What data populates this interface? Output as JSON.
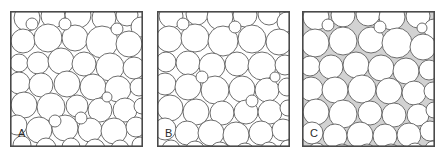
{
  "figure": {
    "background_color": "#ffffff",
    "panel_count": 3
  },
  "style": {
    "border_color": "#4a4a4a",
    "border_width": 1.6,
    "circle_stroke": "#6e6e6e",
    "circle_stroke_width": 1.0,
    "circle_fill_white": "#ffffff",
    "panel_fill_white": "#ffffff",
    "panel_fill_gray": "#d2d2d2",
    "label_color": "#2b2b2b"
  },
  "panels": [
    {
      "id": "panel-a",
      "label": "A",
      "label_x": 8,
      "label_y": 117,
      "x": 10,
      "y": 11,
      "width": 133,
      "height": 136,
      "interstitial_shaded": false,
      "interstitial_color": "#ffffff",
      "circle_count": 47,
      "circles": [
        {
          "cx": 17,
          "cy": 7,
          "r": 13
        },
        {
          "cx": 43,
          "cy": 5,
          "r": 12
        },
        {
          "cx": 68,
          "cy": 4,
          "r": 13
        },
        {
          "cx": 94,
          "cy": 7,
          "r": 12
        },
        {
          "cx": 117,
          "cy": 4,
          "r": 11
        },
        {
          "cx": 131,
          "cy": 16,
          "r": 10
        },
        {
          "cx": 13,
          "cy": 30,
          "r": 12
        },
        {
          "cx": 38,
          "cy": 27,
          "r": 14
        },
        {
          "cx": 65,
          "cy": 27,
          "r": 13
        },
        {
          "cx": 92,
          "cy": 31,
          "r": 16
        },
        {
          "cx": 119,
          "cy": 33,
          "r": 13
        },
        {
          "cx": 9,
          "cy": 52,
          "r": 9
        },
        {
          "cx": 28,
          "cy": 52,
          "r": 11
        },
        {
          "cx": 51,
          "cy": 50,
          "r": 13
        },
        {
          "cx": 74,
          "cy": 53,
          "r": 12
        },
        {
          "cx": 100,
          "cy": 56,
          "r": 14
        },
        {
          "cx": 124,
          "cy": 57,
          "r": 11
        },
        {
          "cx": 9,
          "cy": 72,
          "r": 11
        },
        {
          "cx": 31,
          "cy": 74,
          "r": 12
        },
        {
          "cx": 57,
          "cy": 73,
          "r": 13
        },
        {
          "cx": 83,
          "cy": 76,
          "r": 13
        },
        {
          "cx": 108,
          "cy": 78,
          "r": 13
        },
        {
          "cx": 129,
          "cy": 76,
          "r": 9
        },
        {
          "cx": 14,
          "cy": 94,
          "r": 13
        },
        {
          "cx": 41,
          "cy": 96,
          "r": 14
        },
        {
          "cx": 67,
          "cy": 95,
          "r": 11
        },
        {
          "cx": 90,
          "cy": 99,
          "r": 12
        },
        {
          "cx": 115,
          "cy": 99,
          "r": 12
        },
        {
          "cx": 132,
          "cy": 95,
          "r": 8
        },
        {
          "cx": 7,
          "cy": 114,
          "r": 10
        },
        {
          "cx": 29,
          "cy": 119,
          "r": 13
        },
        {
          "cx": 55,
          "cy": 117,
          "r": 13
        },
        {
          "cx": 80,
          "cy": 119,
          "r": 12
        },
        {
          "cx": 104,
          "cy": 120,
          "r": 13
        },
        {
          "cx": 126,
          "cy": 116,
          "r": 10
        },
        {
          "cx": 12,
          "cy": 134,
          "r": 9
        },
        {
          "cx": 36,
          "cy": 137,
          "r": 10
        },
        {
          "cx": 61,
          "cy": 136,
          "r": 9
        },
        {
          "cx": 85,
          "cy": 138,
          "r": 10
        },
        {
          "cx": 110,
          "cy": 138,
          "r": 9
        },
        {
          "cx": 130,
          "cy": 134,
          "r": 8
        },
        {
          "cx": 22,
          "cy": 13,
          "r": 6
        },
        {
          "cx": 55,
          "cy": 13,
          "r": 6
        },
        {
          "cx": 107,
          "cy": 18,
          "r": 6
        },
        {
          "cx": 45,
          "cy": 110,
          "r": 6
        },
        {
          "cx": 71,
          "cy": 107,
          "r": 6
        },
        {
          "cx": 97,
          "cy": 86,
          "r": 5
        }
      ]
    },
    {
      "id": "panel-b",
      "label": "B",
      "label_x": 8,
      "label_y": 117,
      "x": 157,
      "y": 11,
      "width": 133,
      "height": 136,
      "interstitial_shaded": false,
      "interstitial_color": "#ffffff",
      "circle_count": 46,
      "circles": [
        {
          "cx": 14,
          "cy": 5,
          "r": 12
        },
        {
          "cx": 40,
          "cy": 3,
          "r": 11
        },
        {
          "cx": 63,
          "cy": 6,
          "r": 13
        },
        {
          "cx": 88,
          "cy": 4,
          "r": 12
        },
        {
          "cx": 112,
          "cy": 3,
          "r": 11
        },
        {
          "cx": 130,
          "cy": 11,
          "r": 10
        },
        {
          "cx": 12,
          "cy": 28,
          "r": 13
        },
        {
          "cx": 38,
          "cy": 27,
          "r": 14
        },
        {
          "cx": 66,
          "cy": 30,
          "r": 15
        },
        {
          "cx": 95,
          "cy": 28,
          "r": 14
        },
        {
          "cx": 122,
          "cy": 31,
          "r": 13
        },
        {
          "cx": 9,
          "cy": 51,
          "r": 10
        },
        {
          "cx": 31,
          "cy": 52,
          "r": 12
        },
        {
          "cx": 55,
          "cy": 55,
          "r": 13
        },
        {
          "cx": 80,
          "cy": 53,
          "r": 12
        },
        {
          "cx": 105,
          "cy": 55,
          "r": 14
        },
        {
          "cx": 128,
          "cy": 54,
          "r": 10
        },
        {
          "cx": 8,
          "cy": 73,
          "r": 11
        },
        {
          "cx": 31,
          "cy": 76,
          "r": 13
        },
        {
          "cx": 58,
          "cy": 79,
          "r": 14
        },
        {
          "cx": 85,
          "cy": 78,
          "r": 13
        },
        {
          "cx": 110,
          "cy": 79,
          "r": 12
        },
        {
          "cx": 130,
          "cy": 76,
          "r": 9
        },
        {
          "cx": 13,
          "cy": 97,
          "r": 13
        },
        {
          "cx": 39,
          "cy": 101,
          "r": 13
        },
        {
          "cx": 65,
          "cy": 102,
          "r": 12
        },
        {
          "cx": 89,
          "cy": 101,
          "r": 12
        },
        {
          "cx": 113,
          "cy": 101,
          "r": 12
        },
        {
          "cx": 131,
          "cy": 97,
          "r": 8
        },
        {
          "cx": 8,
          "cy": 118,
          "r": 11
        },
        {
          "cx": 30,
          "cy": 122,
          "r": 12
        },
        {
          "cx": 54,
          "cy": 122,
          "r": 13
        },
        {
          "cx": 79,
          "cy": 124,
          "r": 13
        },
        {
          "cx": 104,
          "cy": 122,
          "r": 12
        },
        {
          "cx": 126,
          "cy": 119,
          "r": 11
        },
        {
          "cx": 14,
          "cy": 138,
          "r": 9
        },
        {
          "cx": 38,
          "cy": 140,
          "r": 10
        },
        {
          "cx": 63,
          "cy": 141,
          "r": 10
        },
        {
          "cx": 88,
          "cy": 142,
          "r": 10
        },
        {
          "cx": 112,
          "cy": 140,
          "r": 9
        },
        {
          "cx": 131,
          "cy": 137,
          "r": 8
        },
        {
          "cx": 26,
          "cy": 13,
          "r": 6
        },
        {
          "cx": 78,
          "cy": 16,
          "r": 6
        },
        {
          "cx": 45,
          "cy": 66,
          "r": 6
        },
        {
          "cx": 95,
          "cy": 90,
          "r": 6
        },
        {
          "cx": 118,
          "cy": 66,
          "r": 5
        }
      ]
    },
    {
      "id": "panel-c",
      "label": "C",
      "label_x": 8,
      "label_y": 117,
      "x": 302,
      "y": 11,
      "width": 133,
      "height": 136,
      "interstitial_shaded": true,
      "interstitial_color": "#d2d2d2",
      "circle_count": 44,
      "circles": [
        {
          "cx": 14,
          "cy": 6,
          "r": 13
        },
        {
          "cx": 41,
          "cy": 4,
          "r": 12
        },
        {
          "cx": 66,
          "cy": 3,
          "r": 12
        },
        {
          "cx": 90,
          "cy": 6,
          "r": 13
        },
        {
          "cx": 116,
          "cy": 5,
          "r": 12
        },
        {
          "cx": 132,
          "cy": 18,
          "r": 10
        },
        {
          "cx": 13,
          "cy": 32,
          "r": 14
        },
        {
          "cx": 41,
          "cy": 30,
          "r": 14
        },
        {
          "cx": 69,
          "cy": 29,
          "r": 13
        },
        {
          "cx": 95,
          "cy": 32,
          "r": 15
        },
        {
          "cx": 121,
          "cy": 36,
          "r": 13
        },
        {
          "cx": 8,
          "cy": 55,
          "r": 10
        },
        {
          "cx": 29,
          "cy": 56,
          "r": 12
        },
        {
          "cx": 54,
          "cy": 54,
          "r": 13
        },
        {
          "cx": 79,
          "cy": 57,
          "r": 13
        },
        {
          "cx": 104,
          "cy": 60,
          "r": 13
        },
        {
          "cx": 127,
          "cy": 59,
          "r": 10
        },
        {
          "cx": 9,
          "cy": 78,
          "r": 12
        },
        {
          "cx": 33,
          "cy": 79,
          "r": 13
        },
        {
          "cx": 60,
          "cy": 78,
          "r": 14
        },
        {
          "cx": 87,
          "cy": 80,
          "r": 13
        },
        {
          "cx": 112,
          "cy": 82,
          "r": 12
        },
        {
          "cx": 131,
          "cy": 80,
          "r": 9
        },
        {
          "cx": 14,
          "cy": 101,
          "r": 13
        },
        {
          "cx": 41,
          "cy": 103,
          "r": 14
        },
        {
          "cx": 68,
          "cy": 102,
          "r": 12
        },
        {
          "cx": 92,
          "cy": 104,
          "r": 12
        },
        {
          "cx": 116,
          "cy": 104,
          "r": 11
        },
        {
          "cx": 132,
          "cy": 99,
          "r": 8
        },
        {
          "cx": 10,
          "cy": 122,
          "r": 11
        },
        {
          "cx": 33,
          "cy": 125,
          "r": 12
        },
        {
          "cx": 58,
          "cy": 124,
          "r": 13
        },
        {
          "cx": 83,
          "cy": 125,
          "r": 12
        },
        {
          "cx": 107,
          "cy": 124,
          "r": 12
        },
        {
          "cx": 128,
          "cy": 120,
          "r": 10
        },
        {
          "cx": 15,
          "cy": 141,
          "r": 9
        },
        {
          "cx": 40,
          "cy": 143,
          "r": 10
        },
        {
          "cx": 65,
          "cy": 142,
          "r": 9
        },
        {
          "cx": 89,
          "cy": 143,
          "r": 10
        },
        {
          "cx": 113,
          "cy": 141,
          "r": 9
        },
        {
          "cx": 131,
          "cy": 138,
          "r": 8
        },
        {
          "cx": 26,
          "cy": 14,
          "r": 6
        },
        {
          "cx": 78,
          "cy": 16,
          "r": 6
        },
        {
          "cx": 120,
          "cy": 17,
          "r": 5
        }
      ]
    }
  ]
}
